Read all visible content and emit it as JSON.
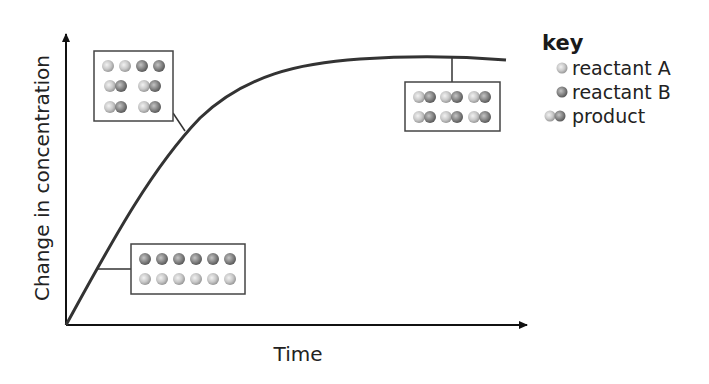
{
  "diagram": {
    "y_axis_label": "Change in concentration",
    "x_axis_label": "Time",
    "curve": {
      "description": "Concentration change rises steeply then levels off (plateau)",
      "points": [
        [
          66,
          325
        ],
        [
          95,
          268
        ],
        [
          184,
          130
        ],
        [
          260,
          75
        ],
        [
          340,
          62
        ],
        [
          450,
          57
        ],
        [
          506,
          60
        ]
      ]
    },
    "insets": [
      {
        "name": "early-stage",
        "rows": [
          [
            "B",
            "B",
            "B",
            "B",
            "B",
            "B"
          ],
          [
            "A",
            "A",
            "A",
            "A",
            "A",
            "A"
          ]
        ]
      },
      {
        "name": "mid-stage",
        "rows": [
          [
            "A",
            "A",
            "B",
            "B"
          ],
          [
            "AB",
            "AB"
          ],
          [
            "AB",
            "AB"
          ]
        ]
      },
      {
        "name": "late-stage",
        "rows": [
          [
            "AB",
            "AB",
            "AB"
          ],
          [
            "AB",
            "AB",
            "AB"
          ]
        ]
      }
    ]
  },
  "key": {
    "title": "key",
    "items": [
      {
        "label": "reactant A",
        "symbol": "light-sphere"
      },
      {
        "label": "reactant B",
        "symbol": "dark-sphere"
      },
      {
        "label": "product",
        "symbol": "light-dark-pair"
      }
    ]
  },
  "colors": {
    "reactant_a": "#c9c9c9",
    "reactant_b": "#8a8a8a",
    "line": "#333333"
  }
}
